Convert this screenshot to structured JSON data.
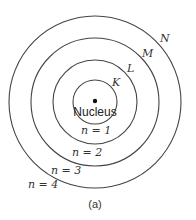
{
  "diagram": {
    "caption": "(a)",
    "nucleus_label": "Nucleus",
    "shells": [
      {
        "letter": "K",
        "n_label": "n = 1",
        "radius": 22
      },
      {
        "letter": "L",
        "n_label": "n = 2",
        "radius": 42
      },
      {
        "letter": "M",
        "n_label": "n = 3",
        "radius": 64
      },
      {
        "letter": "N",
        "n_label": "n = 4",
        "radius": 86
      }
    ],
    "colors": {
      "stroke": "#444444",
      "text": "#333333",
      "background": "#ffffff"
    }
  }
}
